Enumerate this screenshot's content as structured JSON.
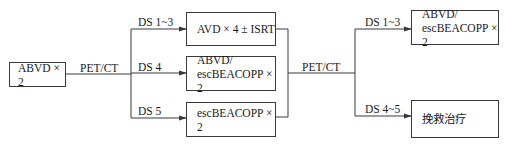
{
  "diagram": {
    "start": {
      "label": "ABVD × 2"
    },
    "first_assessment": {
      "label": "PET/CT"
    },
    "branches_1": [
      {
        "condition": "DS 1~3",
        "treatment_lines": [
          "AVD × 4 ± ISRT"
        ]
      },
      {
        "condition": "DS 4",
        "treatment_lines": [
          "ABVD/",
          "escBEACOPP × 2"
        ]
      },
      {
        "condition": "DS 5",
        "treatment_lines": [
          "escBEACOPP × 2"
        ]
      }
    ],
    "second_assessment": {
      "label": "PET/CT"
    },
    "branches_2": [
      {
        "condition": "DS 1~3",
        "treatment_lines": [
          "ABVD/",
          "escBEACOPP × 2"
        ]
      },
      {
        "condition": "DS 4~5",
        "treatment_lines": [
          "挽救治疗"
        ]
      }
    ],
    "colors": {
      "line": "#3a3a3a",
      "text": "#1a1a1a",
      "background": "#ffffff"
    }
  }
}
